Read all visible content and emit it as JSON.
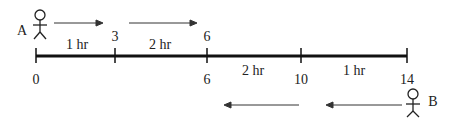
{
  "diagram": {
    "person_a": {
      "label": "A"
    },
    "person_b": {
      "label": "B"
    },
    "top_ticks": [
      "3",
      "6"
    ],
    "bottom_ticks": [
      "0",
      "6",
      "10",
      "14"
    ],
    "top_segments": [
      "1 hr",
      "2 hr"
    ],
    "bottom_segments": [
      "2 hr",
      "1 hr"
    ],
    "colors": {
      "line": "#111111",
      "arrow": "#333333"
    }
  }
}
